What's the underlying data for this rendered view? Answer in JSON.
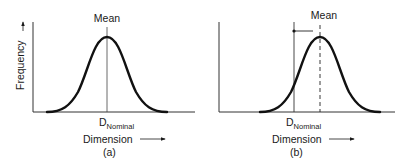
{
  "panels": [
    {
      "id": "a",
      "caption": "(a)",
      "mean_label": "Mean",
      "nominal_label_main": "D",
      "nominal_label_sub": "Nominal",
      "x_axis_label": "Dimension",
      "y_axis_label": "Frequency",
      "mean_offset_from_nominal": false
    },
    {
      "id": "b",
      "caption": "(b)",
      "mean_label": "Mean",
      "nominal_label_main": "D",
      "nominal_label_sub": "Nominal",
      "x_axis_label": "Dimension",
      "mean_offset_from_nominal": true
    }
  ]
}
